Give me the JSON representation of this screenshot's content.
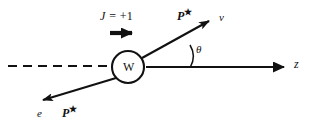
{
  "figure": {
    "kind": "physics-feynman-style-decay-diagram",
    "background_color": "#ffffff",
    "ink_color": "#111111",
    "width_px": 309,
    "height_px": 126
  },
  "labels": {
    "spin": {
      "symbol": "J",
      "relation": " = +1",
      "full": "J = +1"
    },
    "boson": "W",
    "neutrino_momentum": {
      "base": "P",
      "superscript": "★",
      "full": "P★"
    },
    "neutrino": "ν",
    "angle": "θ",
    "axis": "z",
    "electron": "e",
    "electron_momentum": {
      "base": "P",
      "superscript": "★",
      "full": "P★"
    }
  },
  "geometry": {
    "w_circle": {
      "cx": 128,
      "cy": 67,
      "r": 16
    },
    "dashed_line": {
      "x1": 8,
      "y1": 66,
      "x2": 107,
      "y2": 66
    },
    "z_axis": {
      "x1": 146,
      "y1": 67,
      "x2": 291,
      "y2": 67
    },
    "neutrino_vector": {
      "x1": 142,
      "y1": 58,
      "x2": 215,
      "y2": 18
    },
    "electron_vector": {
      "x1": 116,
      "y1": 78,
      "x2": 37,
      "y2": 102
    },
    "spin_arrow": {
      "x1": 110,
      "y1": 33,
      "x2": 141,
      "y2": 33
    },
    "theta_arc": {
      "cx": 190,
      "cy": 67,
      "r": 22,
      "from_deg": 0,
      "to_deg": 28
    }
  }
}
